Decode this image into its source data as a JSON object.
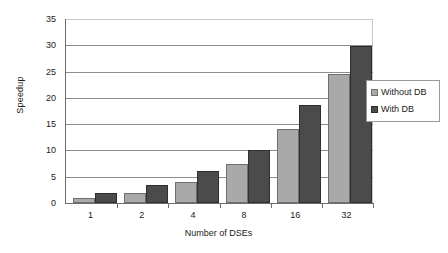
{
  "chart_data": {
    "type": "bar",
    "title": "",
    "xlabel": "Number of DSEs",
    "ylabel": "Speedup",
    "categories": [
      "1",
      "2",
      "4",
      "8",
      "16",
      "32"
    ],
    "series": [
      {
        "name": "Without DB",
        "color": "#a9a9a9",
        "values": [
          1,
          2,
          4,
          7.5,
          14,
          24.5
        ]
      },
      {
        "name": "With DB",
        "color": "#4b4b4b",
        "values": [
          1.9,
          3.5,
          6,
          10,
          18.7,
          29.8
        ]
      }
    ],
    "ylim": [
      0,
      35
    ],
    "yticks": [
      0,
      5,
      10,
      15,
      20,
      25,
      30,
      35
    ],
    "grid": true,
    "legend_position": "right"
  },
  "legend": {
    "entries": [
      {
        "label": "Without DB"
      },
      {
        "label": "With DB"
      }
    ]
  }
}
